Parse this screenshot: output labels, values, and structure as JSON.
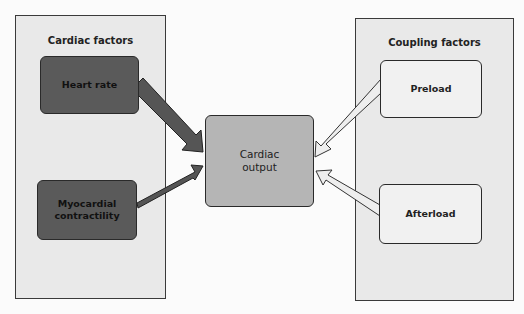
{
  "left_panel": {
    "title": "Cardiac factors",
    "nodes": [
      {
        "label": "Heart rate"
      },
      {
        "label": "Myocardial contractility"
      }
    ]
  },
  "right_panel": {
    "title": "Coupling factors",
    "nodes": [
      {
        "label": "Preload"
      },
      {
        "label": "Afterload"
      }
    ]
  },
  "center": {
    "label": "Cardiac output"
  },
  "colors": {
    "dark_node": "#5a5a5a",
    "center_node": "#b5b5b5",
    "panel": "#e9e9e9",
    "light_node": "#f1f1f1"
  }
}
